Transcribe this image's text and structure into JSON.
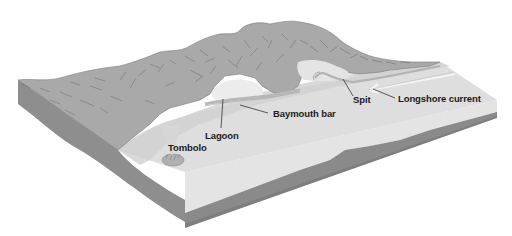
{
  "diagram": {
    "colors": {
      "background": "#ffffff",
      "hills": "#a9a9a9",
      "hill_strokes": "#6a6a6a",
      "left_side_face": "#8e8e8e",
      "front_face_sediment": "#e2e2e2",
      "front_face_bedrock": "#888888",
      "sea_surface": "#dcdcdc",
      "shore_lowland": "#cfcfcf",
      "lagoon_water": "#ececec",
      "leader_line": "#333333",
      "label_text": "#1a1a1a"
    },
    "labels": [
      {
        "id": "lagoon",
        "text": "Lagoon"
      },
      {
        "id": "baymouth-bar",
        "text": "Baymouth bar"
      },
      {
        "id": "spit",
        "text": "Spit"
      },
      {
        "id": "longshore-current",
        "text": "Longshore current"
      },
      {
        "id": "tombolo",
        "text": "Tombolo"
      }
    ]
  }
}
